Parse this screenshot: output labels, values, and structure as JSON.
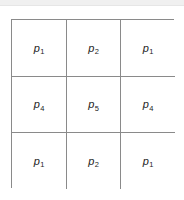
{
  "figure": {
    "name": "3x3-kernel-coefficient-grid",
    "border_color": "#8a8a8a",
    "background_color": "#ffffff",
    "text_color": "#1d1d1d",
    "top_band_color": "#f0f0f0",
    "rows": [
      {
        "cells": [
          {
            "symbol": "p",
            "subscript": "1"
          },
          {
            "symbol": "p",
            "subscript": "2"
          },
          {
            "symbol": "p",
            "subscript": "1"
          }
        ]
      },
      {
        "cells": [
          {
            "symbol": "p",
            "subscript": "4"
          },
          {
            "symbol": "p",
            "subscript": "5"
          },
          {
            "symbol": "p",
            "subscript": "4"
          }
        ]
      },
      {
        "cells": [
          {
            "symbol": "p",
            "subscript": "1"
          },
          {
            "symbol": "p",
            "subscript": "2"
          },
          {
            "symbol": "p",
            "subscript": "1"
          }
        ]
      }
    ]
  }
}
